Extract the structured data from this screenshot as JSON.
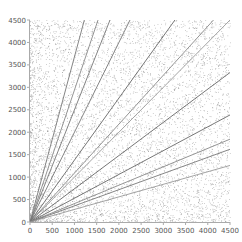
{
  "chart_data": {
    "type": "scatter",
    "title": "",
    "xlabel": "",
    "ylabel": "",
    "xlim": [
      0,
      4500
    ],
    "ylim": [
      0,
      4500
    ],
    "grid": false,
    "legend": null,
    "x_ticks": [
      0,
      500,
      1000,
      1500,
      2000,
      2500,
      3000,
      3500,
      4000,
      4500
    ],
    "y_ticks": [
      0,
      500,
      1000,
      1500,
      2000,
      2500,
      3000,
      3500,
      4000,
      4500
    ],
    "scatter": {
      "point_count": 6000,
      "color": "#808080",
      "seed": 12345
    },
    "rays": [
      {
        "slope": 3.68,
        "color": "#777777"
      },
      {
        "slope": 2.94,
        "color": "#888888"
      },
      {
        "slope": 2.5,
        "color": "#777777"
      },
      {
        "slope": 2.0,
        "color": "#777777"
      },
      {
        "slope": 1.38,
        "color": "#666666"
      },
      {
        "slope": 1.09,
        "color": "#888888"
      },
      {
        "slope": 1.0,
        "color": "#999999"
      },
      {
        "slope": 0.74,
        "color": "#666666"
      },
      {
        "slope": 0.53,
        "color": "#666666"
      },
      {
        "slope": 0.41,
        "color": "#888888"
      },
      {
        "slope": 0.36,
        "color": "#777777"
      },
      {
        "slope": 0.28,
        "color": "#999999"
      }
    ]
  },
  "layout": {
    "plot_left": 30,
    "plot_right": 230,
    "plot_top": 20,
    "plot_bottom": 222
  }
}
